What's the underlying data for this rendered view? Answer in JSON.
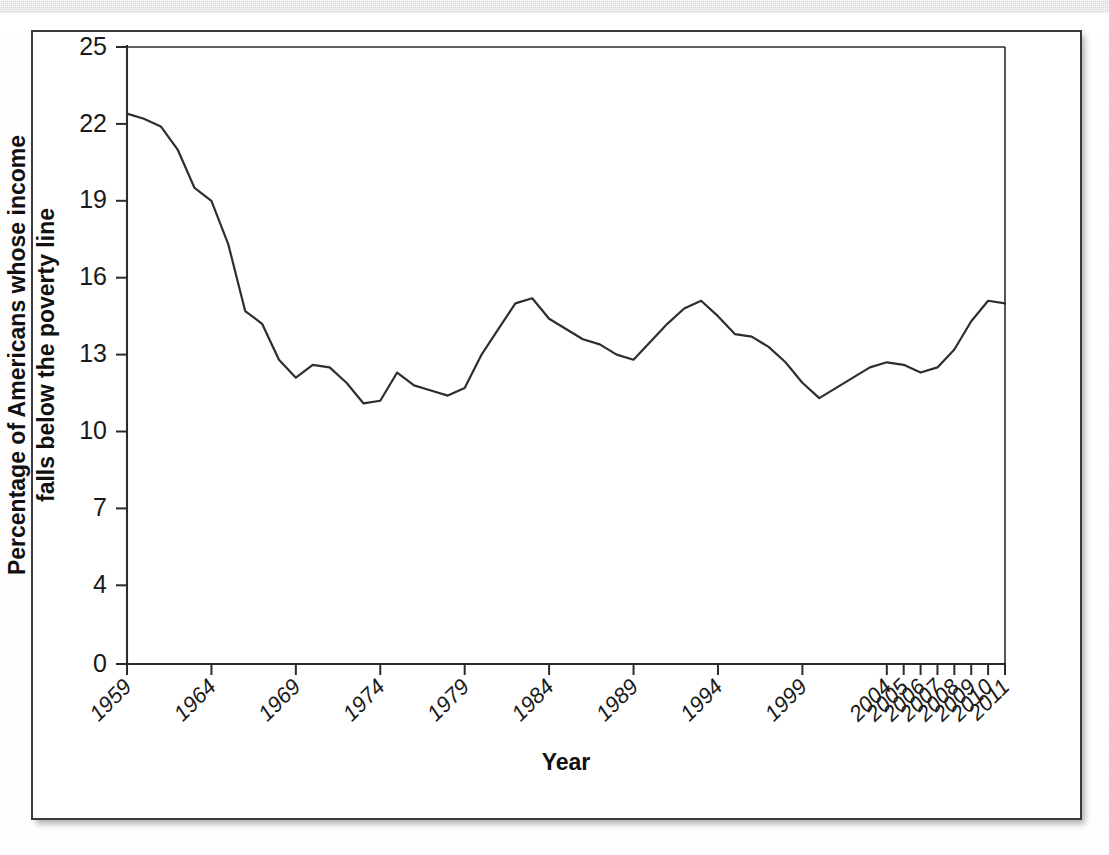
{
  "figure": {
    "background_color": "#ffffff",
    "frame_color": "#3a3a3a",
    "line_color": "#2e2e2e",
    "scan_band_color": "#d9d9d9"
  },
  "axes": {
    "x_title": "Year",
    "y_title_line1": "Percentage of Americans whose income",
    "y_title_line2": "falls below the poverty line"
  },
  "chart_data": {
    "type": "line",
    "title": "",
    "xlabel": "Year",
    "ylabel": "Percentage of Americans whose income falls below the poverty line",
    "xlim": [
      1959,
      2011
    ],
    "ylim": [
      0,
      25
    ],
    "grid": false,
    "legend": "none",
    "y_ticks": [
      25,
      22,
      19,
      16,
      13,
      10,
      7,
      4,
      0
    ],
    "x_ticks": [
      1959,
      1964,
      1969,
      1974,
      1979,
      1984,
      1989,
      1994,
      1999,
      2004,
      2005,
      2006,
      2007,
      2008,
      2009,
      2010,
      2011
    ],
    "x_tick_labels": [
      "1959",
      "1964",
      "1969",
      "1974",
      "1979",
      "1984",
      "1989",
      "1994",
      "1999",
      "2004",
      "2005",
      "2006",
      "2007",
      "2008",
      "2009",
      "2010",
      "2011"
    ],
    "series": [
      {
        "name": "Poverty rate",
        "x": [
          1959,
          1960,
          1961,
          1962,
          1963,
          1964,
          1965,
          1966,
          1967,
          1968,
          1969,
          1970,
          1971,
          1972,
          1973,
          1974,
          1975,
          1976,
          1977,
          1978,
          1979,
          1980,
          1981,
          1982,
          1983,
          1984,
          1985,
          1986,
          1987,
          1988,
          1989,
          1990,
          1991,
          1992,
          1993,
          1994,
          1995,
          1996,
          1997,
          1998,
          1999,
          2000,
          2001,
          2002,
          2003,
          2004,
          2005,
          2006,
          2007,
          2008,
          2009,
          2010,
          2011
        ],
        "values": [
          22.4,
          22.2,
          21.9,
          21.0,
          19.5,
          19.0,
          17.3,
          14.7,
          14.2,
          12.8,
          12.1,
          12.6,
          12.5,
          11.9,
          11.1,
          11.2,
          12.3,
          11.8,
          11.6,
          11.4,
          11.7,
          13.0,
          14.0,
          15.0,
          15.2,
          14.4,
          14.0,
          13.6,
          13.4,
          13.0,
          12.8,
          13.5,
          14.2,
          14.8,
          15.1,
          14.5,
          13.8,
          13.7,
          13.3,
          12.7,
          11.9,
          11.3,
          11.7,
          12.1,
          12.5,
          12.7,
          12.6,
          12.3,
          12.5,
          13.2,
          14.3,
          15.1,
          15.0
        ]
      }
    ]
  }
}
